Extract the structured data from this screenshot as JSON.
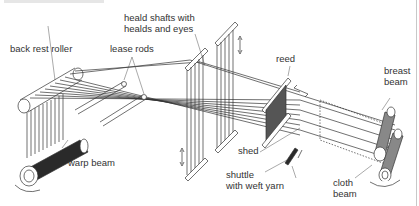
{
  "diagram": {
    "labels": {
      "heald_shafts": [
        "heald shafts with",
        "healds and eyes"
      ],
      "back_rest_roller": "back rest roller",
      "lease_rods": "lease rods",
      "reed": "reed",
      "breast_beam": [
        "breast",
        "beam"
      ],
      "warp_beam": "warp beam",
      "shed": "shed",
      "shuttle": [
        "shuttle",
        "with weft yarn"
      ],
      "cloth_beam": [
        "cloth",
        "beam"
      ]
    },
    "colors": {
      "line": "#333333",
      "fill_dark": "#2a2a2a",
      "bg": "#ffffff"
    }
  }
}
